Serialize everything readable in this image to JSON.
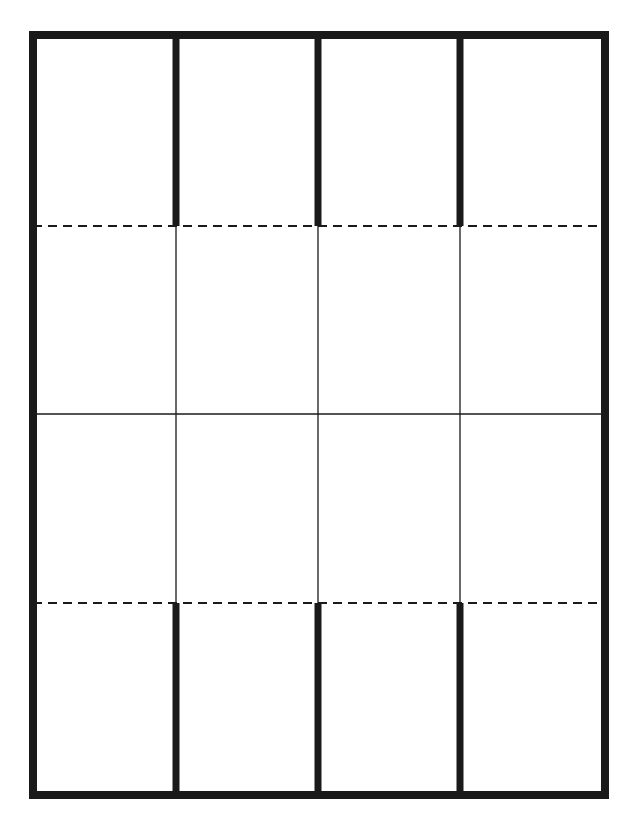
{
  "diagram": {
    "title": "",
    "colors": {
      "background": "#ffffff",
      "stroke": "#1a1a1a"
    },
    "outer_border": {
      "x": 33,
      "y": 35,
      "width": 572,
      "height": 760,
      "stroke_width": 8
    },
    "columns_x": [
      176,
      318,
      460
    ],
    "rows_y": {
      "top_dashed": 226,
      "middle_solid": 414,
      "bottom_dashed": 603
    },
    "cut_lines": {
      "stroke_width": 7,
      "top_segments": [
        {
          "x": 176,
          "y1": 35,
          "y2": 226
        },
        {
          "x": 318,
          "y1": 35,
          "y2": 226
        },
        {
          "x": 460,
          "y1": 35,
          "y2": 226
        }
      ],
      "bottom_segments": [
        {
          "x": 176,
          "y1": 603,
          "y2": 795
        },
        {
          "x": 318,
          "y1": 603,
          "y2": 795
        },
        {
          "x": 460,
          "y1": 603,
          "y2": 795
        }
      ]
    },
    "fold_lines": {
      "dash": "9 6",
      "stroke_width": 2,
      "lines": [
        {
          "y": 226,
          "x1": 33,
          "x2": 605
        },
        {
          "y": 603,
          "x1": 33,
          "x2": 605
        }
      ]
    },
    "crease_lines": {
      "stroke_width": 1.3,
      "vertical": [
        {
          "x": 176,
          "y1": 226,
          "y2": 603
        },
        {
          "x": 318,
          "y1": 226,
          "y2": 603
        },
        {
          "x": 460,
          "y1": 226,
          "y2": 603
        }
      ],
      "horizontal": [
        {
          "y": 414,
          "x1": 33,
          "x2": 605
        }
      ]
    }
  }
}
